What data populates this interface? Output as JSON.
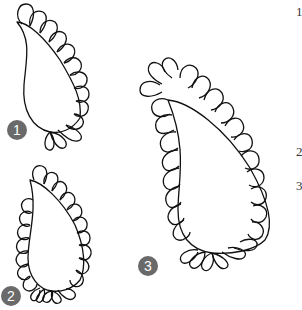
{
  "figure": {
    "stroke_color": "#111111",
    "badge_color": "#6a6a6a",
    "badge_text_color": "#ffffff"
  },
  "badges": [
    {
      "label": "1",
      "x": 7,
      "y": 120
    },
    {
      "label": "2",
      "x": 1,
      "y": 286
    },
    {
      "label": "3",
      "x": 138,
      "y": 256
    }
  ],
  "edge_numbers": [
    {
      "label": "1",
      "y": 4
    },
    {
      "label": "2",
      "y": 144
    },
    {
      "label": "3",
      "y": 178
    }
  ]
}
